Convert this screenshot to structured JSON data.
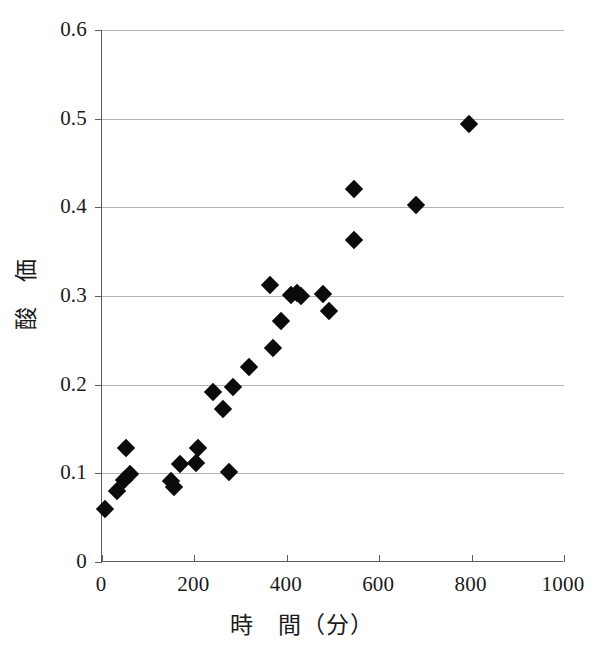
{
  "chart_data": {
    "type": "scatter",
    "title": "",
    "xlabel": "時　間（分）",
    "ylabel": "酸　価",
    "xlim": [
      0,
      1000
    ],
    "ylim": [
      0,
      0.6
    ],
    "xticks": [
      0,
      200,
      400,
      600,
      800,
      1000
    ],
    "yticks": [
      0,
      0.1,
      0.2,
      0.3,
      0.4,
      0.5,
      0.6
    ],
    "xtick_labels": [
      "0",
      "200",
      "400",
      "600",
      "800",
      "1000"
    ],
    "ytick_labels": [
      "0",
      "0.1",
      "0.2",
      "0.3",
      "0.4",
      "0.5",
      "0.6"
    ],
    "grid": "horizontal",
    "legend": "none",
    "marker": "filled-diamond",
    "marker_color": "#0b0b0b",
    "series": [
      {
        "name": "酸価",
        "points": [
          [
            6,
            0.06
          ],
          [
            33,
            0.08
          ],
          [
            48,
            0.093
          ],
          [
            52,
            0.129
          ],
          [
            60,
            0.099
          ],
          [
            150,
            0.091
          ],
          [
            156,
            0.085
          ],
          [
            169,
            0.11
          ],
          [
            203,
            0.112
          ],
          [
            208,
            0.129
          ],
          [
            240,
            0.192
          ],
          [
            262,
            0.172
          ],
          [
            275,
            0.101
          ],
          [
            283,
            0.197
          ],
          [
            318,
            0.22
          ],
          [
            370,
            0.241
          ],
          [
            364,
            0.312
          ],
          [
            388,
            0.272
          ],
          [
            409,
            0.301
          ],
          [
            422,
            0.303
          ],
          [
            431,
            0.3
          ],
          [
            478,
            0.302
          ],
          [
            492,
            0.283
          ],
          [
            545,
            0.421
          ],
          [
            545,
            0.363
          ],
          [
            680,
            0.403
          ],
          [
            794,
            0.494
          ]
        ]
      }
    ]
  },
  "axes": {
    "x_axis_name": "time-axis",
    "y_axis_name": "acid-value-axis"
  }
}
